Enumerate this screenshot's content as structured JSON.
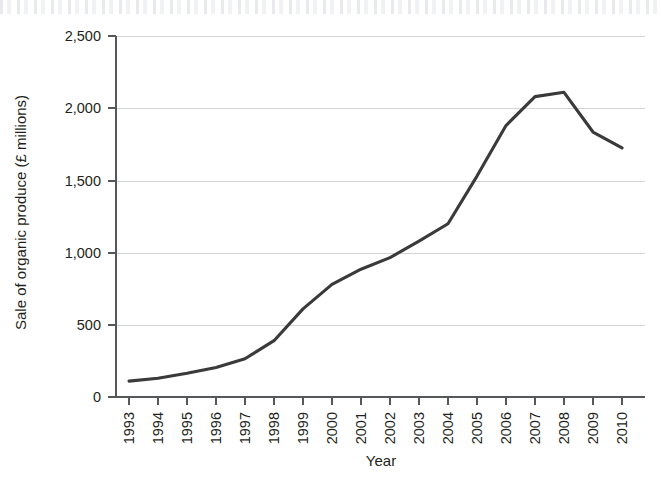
{
  "chart_data": {
    "type": "line",
    "title": "",
    "xlabel": "Year",
    "ylabel": "Sale of organic produce (£ millions)",
    "xlim": [
      1993,
      2010
    ],
    "ylim": [
      0,
      2500
    ],
    "ytick_labels": [
      "0",
      "500",
      "1,000",
      "1,500",
      "2,000",
      "2,500"
    ],
    "ytick_values": [
      0,
      500,
      1000,
      1500,
      2000,
      2500
    ],
    "xtick_labels": [
      "1993",
      "1994",
      "1995",
      "1996",
      "1997",
      "1998",
      "1999",
      "2000",
      "2001",
      "2002",
      "2003",
      "2004",
      "2005",
      "2006",
      "2007",
      "2008",
      "2009",
      "2010"
    ],
    "x": [
      1993,
      1994,
      1995,
      1996,
      1997,
      1998,
      1999,
      2000,
      2001,
      2002,
      2003,
      2004,
      2005,
      2006,
      2007,
      2008,
      2009,
      2010
    ],
    "values": [
      110,
      130,
      165,
      205,
      265,
      390,
      610,
      780,
      885,
      965,
      1080,
      1200,
      1530,
      1880,
      2080,
      2110,
      1835,
      1725
    ],
    "series": [
      {
        "name": "Sale of organic produce",
        "values": [
          110,
          130,
          165,
          205,
          265,
          390,
          610,
          780,
          885,
          965,
          1080,
          1200,
          1530,
          1880,
          2080,
          2110,
          1835,
          1725
        ]
      }
    ],
    "grid": "horizontal",
    "legend": "none",
    "line_color": "#3a3a3a",
    "grid_color": "#d2d4d6",
    "axis_color": "#55585b"
  },
  "axis_labels": {
    "y_title": "Sale of organic produce (£ millions)",
    "x_title": "Year"
  }
}
